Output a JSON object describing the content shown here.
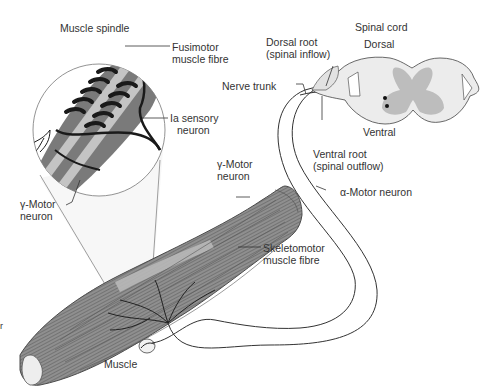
{
  "diagram": {
    "colors": {
      "muscle_fill": "#8f8f8f",
      "muscle_light": "#b3b3b3",
      "spindle_fill": "#7a7a7a",
      "intrafusal_fibre": "#c4c4c4",
      "grey_matter": "#bdbdbd",
      "white_matter": "#ececec",
      "nerve_line": "#2b2b2b",
      "label_text": "#333333",
      "background": "#ffffff"
    },
    "sections": {
      "spindle_inset": "Muscle spindle",
      "spinal_cord": "Spinal cord",
      "muscle": "Muscle"
    },
    "labels": {
      "muscle_spindle": "Muscle spindle",
      "fusimotor_1": "Fusimotor",
      "fusimotor_2": "muscle fibre",
      "ia_1": "Ia sensory",
      "ia_2": "neuron",
      "gamma_inset_1": "γ-Motor",
      "gamma_inset_2": "neuron",
      "spinal_cord": "Spinal cord",
      "dorsal": "Dorsal",
      "ventral": "Ventral",
      "dorsal_root_1": "Dorsal root",
      "dorsal_root_2": "(spinal inflow)",
      "nerve_trunk": "Nerve trunk",
      "ventral_root_1": "Ventral root",
      "ventral_root_2": "(spinal outflow)",
      "gamma_main_1": "γ-Motor",
      "gamma_main_2": "neuron",
      "alpha_motor": "α-Motor neuron",
      "skeletomotor_1": "Skeletomotor",
      "skeletomotor_2": "muscle fibre",
      "muscle": "Muscle",
      "edge_fragment": "r"
    }
  }
}
